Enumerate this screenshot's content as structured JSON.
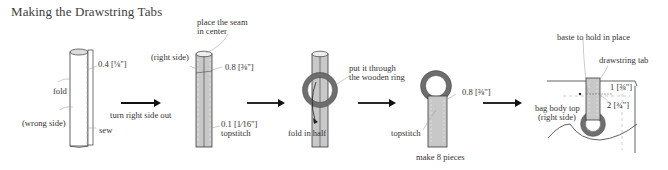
{
  "title": "Making the Drawstring Tabs",
  "colors": {
    "line": "#3a3a3a",
    "fabric_fill": "#c8c8c8",
    "ring": "#6e6e6e",
    "leader": "#9a9a9a"
  },
  "steps": [
    {
      "labels": {
        "seam_allowance": "0.4 [⅛\"]",
        "fold": "fold",
        "wrong_side": "(wrong side)",
        "sew": "sew"
      },
      "arrow_label": "turn right side out"
    },
    {
      "labels": {
        "place_seam": "place the seam",
        "place_seam_2": "in center",
        "right_side": "(right side)",
        "width": "0.8 [⅜\"]",
        "topstitch_margin": "0.1  [1⁄16\"]",
        "topstitch": "topstitch"
      }
    },
    {
      "labels": {
        "put_through": "put it through",
        "put_through_2": "the wooden ring",
        "fold_in_half": "fold in half"
      }
    },
    {
      "labels": {
        "width": "0.8 [⅜\"]",
        "topstitch": "topstitch",
        "make_pieces": "make 8 pieces"
      }
    },
    {
      "labels": {
        "baste": "baste  to hold in place",
        "drawstring_tab": "drawstring tab",
        "dim_1": "1 [⅜\"]",
        "dim_2": "2 [¾\"]",
        "bag_body_top": "bag body top",
        "right_side": "(right side)"
      }
    }
  ]
}
